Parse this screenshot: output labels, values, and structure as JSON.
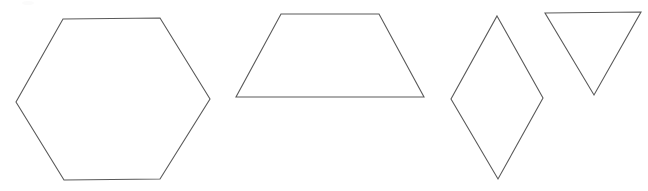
{
  "canvas": {
    "width": 648,
    "height": 191,
    "background_color": "#ffffff",
    "stroke_color": "#5a5a5a",
    "stroke_width": 1.1,
    "fill": "none",
    "description": "Four outlined geometric polygons drawn left to right on a plain white background"
  },
  "shapes": [
    {
      "id": "hexagon",
      "name": "hexagon",
      "sides": 6,
      "label": "",
      "points": "63,19 160,18 210,99 160,179 64,180 16,102",
      "bounds": {
        "x": 16,
        "y": 18,
        "width": 194,
        "height": 162
      }
    },
    {
      "id": "trapezoid",
      "name": "trapezoid",
      "sides": 4,
      "label": "",
      "points": "281,14 379,14 424,97 236,97",
      "bounds": {
        "x": 236,
        "y": 14,
        "width": 188,
        "height": 83
      }
    },
    {
      "id": "rhombus",
      "name": "rhombus",
      "sides": 4,
      "label": "",
      "points": "497,16 543,98 498,179 451,99",
      "bounds": {
        "x": 451,
        "y": 16,
        "width": 92,
        "height": 163
      }
    },
    {
      "id": "triangle",
      "name": "triangle",
      "sides": 3,
      "label": "",
      "points": "545,13 641,12 594,95",
      "bounds": {
        "x": 545,
        "y": 12,
        "width": 96,
        "height": 83
      }
    }
  ]
}
